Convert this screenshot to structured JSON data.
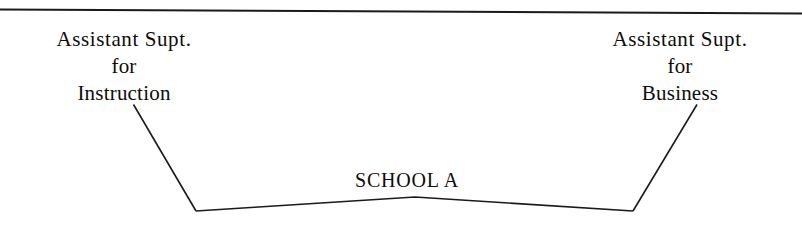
{
  "document": {
    "type": "organizational-chart-fragment",
    "background_color": "#ffffff",
    "ink_color": "#1a1a1a"
  },
  "rules": {
    "top_rule_label": "horizontal-divider"
  },
  "nodes": {
    "left": {
      "name": "assistant-superintendent-instruction",
      "lines": [
        "Assistant  Supt.",
        "for",
        "Instruction"
      ],
      "line1": "Assistant  Supt.",
      "line2": "for",
      "line3": "Instruction"
    },
    "right": {
      "name": "assistant-superintendent-business",
      "lines": [
        "Assistant  Supt.",
        "for",
        "Business"
      ],
      "line1": "Assistant  Supt.",
      "line2": "for",
      "line3": "Business"
    },
    "center": {
      "name": "school-a",
      "label": "SCHOOL A"
    }
  },
  "connectors": {
    "left_branch": "line from Assistant Supt. for Instruction down to School A",
    "right_branch": "line from Assistant Supt. for Business down to School A",
    "baseline": "shallow inverted-V spanning both branch vertices"
  }
}
